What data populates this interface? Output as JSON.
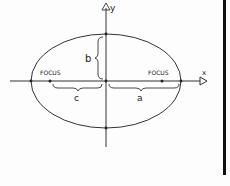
{
  "diagram": {
    "type": "ellipse-with-axes",
    "axes": {
      "x_label": "x",
      "y_label": "y"
    },
    "labels": {
      "focus_left": "FOCUS",
      "focus_right": "FOCUS",
      "semi_major": "a",
      "semi_minor": "b",
      "focal_distance": "c"
    },
    "colors": {
      "ink": "#222222",
      "background": "#fdfdfd",
      "border": "#111111"
    }
  }
}
